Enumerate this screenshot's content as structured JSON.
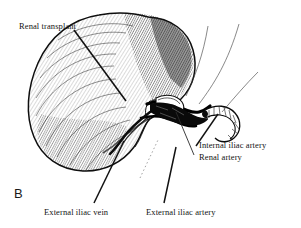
{
  "figure": {
    "panel_label": "B",
    "caption_subject": "renal transplant with iliac vessel anastomosis",
    "style": "pen-and-ink hatched line drawing",
    "background_color": "#ffffff",
    "ink_color": "#111111"
  },
  "labels": {
    "renal_transplant": "Renal transplant",
    "internal_iliac_artery": "Internal iliac artery",
    "renal_artery": "Renal artery",
    "external_iliac_vein": "External iliac vein",
    "external_iliac_artery": "External iliac artery"
  },
  "structures": [
    {
      "name": "renal-transplant-kidney",
      "label": "Renal transplant"
    },
    {
      "name": "internal-iliac-artery-vessel",
      "label": "Internal iliac artery"
    },
    {
      "name": "renal-artery-vessel",
      "label": "Renal artery"
    },
    {
      "name": "external-iliac-vein-vessel",
      "label": "External iliac vein"
    },
    {
      "name": "external-iliac-artery-vessel",
      "label": "External iliac artery"
    }
  ]
}
